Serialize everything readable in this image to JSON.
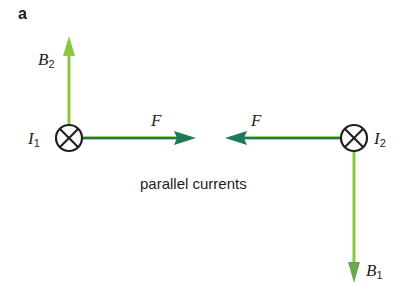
{
  "panel_label": "a",
  "caption": "parallel currents",
  "colors": {
    "force_arrow": "#1e7a55",
    "field_arrow": "#8cc63f",
    "conductor": "#231f20"
  },
  "conductors": [
    {
      "id": "I1",
      "symbol": "I",
      "subscript": "1",
      "direction": "into-page",
      "cx": 69,
      "cy": 138,
      "r": 13
    },
    {
      "id": "I2",
      "symbol": "I",
      "subscript": "2",
      "direction": "into-page",
      "cx": 354,
      "cy": 138,
      "r": 13
    }
  ],
  "labels": {
    "B2": {
      "symbol": "B",
      "subscript": "2"
    },
    "B1": {
      "symbol": "B",
      "subscript": "1"
    },
    "F_left": {
      "symbol": "F"
    },
    "F_right": {
      "symbol": "F"
    },
    "I1": {
      "symbol": "I",
      "subscript": "1"
    },
    "I2": {
      "symbol": "I",
      "subscript": "2"
    }
  }
}
